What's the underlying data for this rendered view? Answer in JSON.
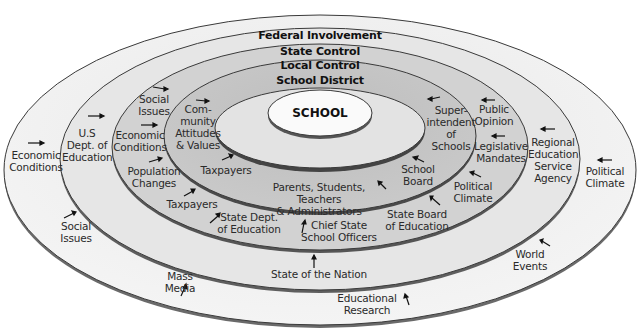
{
  "diagram": {
    "center": "SCHOOL",
    "rings": [
      {
        "id": "school-district",
        "title": "School District",
        "fill": "#c6c6c6"
      },
      {
        "id": "local-control",
        "title": "Local Control",
        "fill": "#d3d3d3"
      },
      {
        "id": "state-control",
        "title": "State Control",
        "fill": "#e2e2e2"
      },
      {
        "id": "federal-involvement",
        "title": "Federal Involvement",
        "fill": "#efefef"
      }
    ],
    "school_district_labels": {
      "community": "Com-\nmunity\nAttitudes\n& Values",
      "taxpayers": "Taxpayers",
      "parents": "Parents, Students, Teachers\n& Administrators",
      "school_board": "School\nBoard",
      "superintendent": "Super-\nintendent\nof\nSchools"
    },
    "local_control_labels": {
      "social_issues": "Social\nIssues",
      "economic_conditions": "Economic\nConditions",
      "population_changes": "Population\nChanges",
      "taxpayers": "Taxpayers",
      "public_opinion": "Public\nOpinion",
      "legislative_mandates": "Legislative\nMandates",
      "political_climate": "Political\nClimate"
    },
    "state_control_labels": {
      "us_dept_education": "U.S\nDept. of\nEducation",
      "state_dept_education": "State Dept.\nof Education",
      "chief_state_school_officers": "Chief State\nSchool Officers",
      "state_board_education": "State Board\nof Education",
      "regional_education_service_agency": "Regional\nEducation\nService\nAgency"
    },
    "federal_labels": {
      "economic_conditions": "Economic\nConditions",
      "social_issues": "Social\nIssues",
      "state_of_the_nation": "State of the Nation",
      "mass_media": "Mass\nMedia",
      "educational_research": "Educational\nResearch",
      "world_events": "World\nEvents",
      "political_climate": "Political\nClimate"
    }
  },
  "colors": {
    "outline": "#3a3a3a",
    "school_fill": "#fafafa",
    "district_inner_fill": "#e4e4e4",
    "text": "#2a2a2a"
  }
}
